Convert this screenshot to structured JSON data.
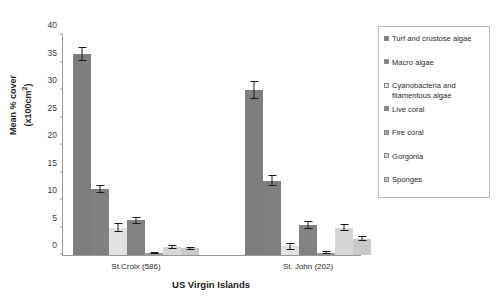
{
  "chart_data": {
    "type": "bar",
    "title": "",
    "subtitle": "",
    "xlabel": "US Virgin Islands",
    "ylabel": "Mean % cover (x100cm2)",
    "ylabel_main": "Mean % cover",
    "ylabel_unit_pre": "(x100cm",
    "ylabel_unit_sup": "2",
    "ylabel_unit_post": ")",
    "ylim": [
      0,
      40
    ],
    "ytick_step": 5,
    "yticks": [
      0,
      5,
      10,
      15,
      20,
      25,
      30,
      35,
      40
    ],
    "grid": false,
    "legend_position": "right",
    "categories": [
      "St.Croix (586)",
      "St. John (202)"
    ],
    "series": [
      {
        "name": "Turf and crustose algae",
        "color": "#7d7d7d",
        "values": [
          36.5,
          30.0
        ],
        "errors": [
          1.3,
          1.6
        ]
      },
      {
        "name": "Macro algae",
        "color": "#808080",
        "values": [
          12.0,
          13.5
        ],
        "errors": [
          0.8,
          1.0
        ]
      },
      {
        "name": "Cyanobacteria and\nfilamentous algae",
        "color": "#e2e2e2",
        "values": [
          5.0,
          1.6
        ],
        "errors": [
          0.9,
          0.6
        ]
      },
      {
        "name": "Live coral",
        "color": "#828282",
        "values": [
          6.3,
          5.5
        ],
        "errors": [
          0.7,
          0.7
        ]
      },
      {
        "name": "Fire coral",
        "color": "#9c9c9c",
        "values": [
          0.3,
          0.4
        ],
        "errors": [
          0.2,
          0.25
        ]
      },
      {
        "name": "Gorgonia",
        "color": "#d6d6d6",
        "values": [
          1.5,
          5.0
        ],
        "errors": [
          0.35,
          0.6
        ]
      },
      {
        "name": "Sponges",
        "color": "#c9c9c9",
        "values": [
          1.2,
          3.0
        ],
        "errors": [
          0.3,
          0.45
        ]
      }
    ]
  }
}
